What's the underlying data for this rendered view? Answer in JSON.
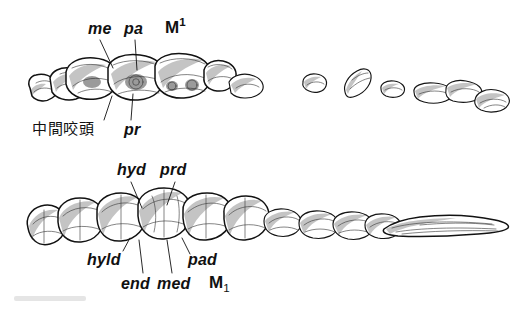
{
  "figure": {
    "background_color": "#ffffff",
    "ink_color": "#121212",
    "caption": "",
    "upper_row": {
      "tooth_designation": "M¹",
      "labels_above": [
        {
          "text": "me",
          "style": "italic"
        },
        {
          "text": "pa",
          "style": "italic"
        }
      ],
      "labels_below": [
        {
          "text": "中間咬頭",
          "style": "cjk"
        },
        {
          "text": "pr",
          "style": "italic"
        }
      ]
    },
    "lower_row": {
      "tooth_designation": "M₁",
      "labels_above": [
        {
          "text": "hyd",
          "style": "italic"
        },
        {
          "text": "prd",
          "style": "italic"
        }
      ],
      "labels_below": [
        {
          "text": "hyld",
          "style": "italic"
        },
        {
          "text": "pad",
          "style": "italic"
        },
        {
          "text": "end",
          "style": "italic"
        },
        {
          "text": "med",
          "style": "italic"
        }
      ]
    }
  },
  "labels": {
    "me": "me",
    "pa": "pa",
    "m_upper": "M",
    "m_upper_index": "1",
    "chukan_koto": "中間咬頭",
    "pr": "pr",
    "hyd": "hyd",
    "prd": "prd",
    "hyld": "hyld",
    "pad": "pad",
    "end": "end",
    "med": "med",
    "m_lower": "M",
    "m_lower_index": "1"
  }
}
